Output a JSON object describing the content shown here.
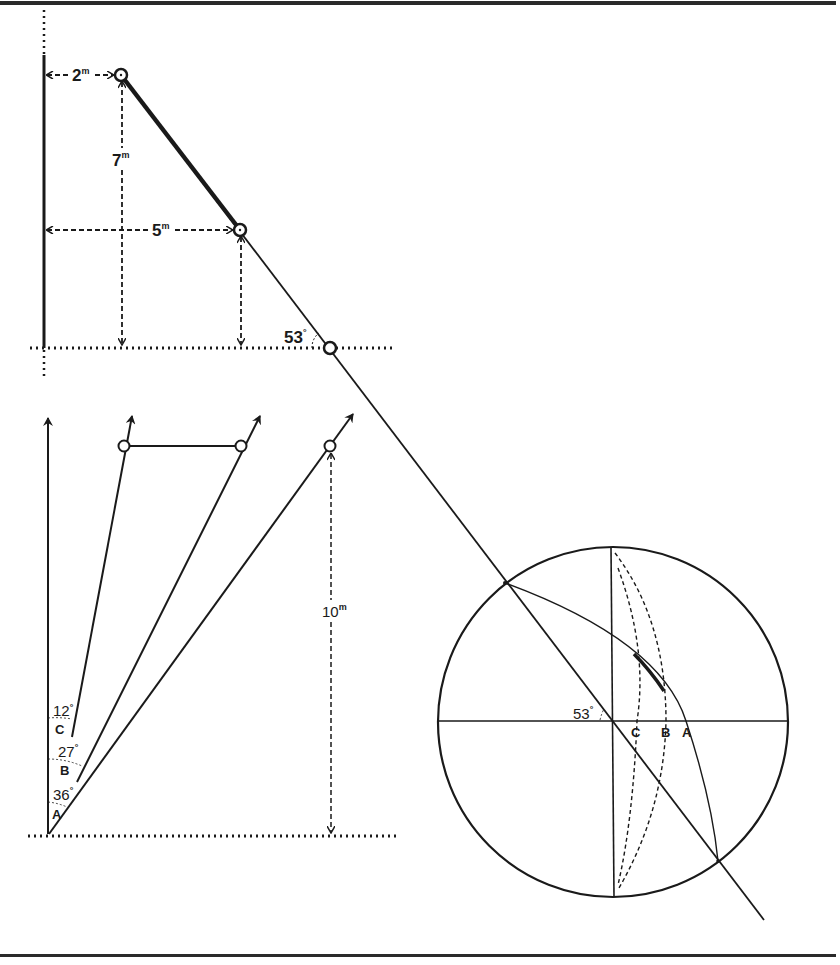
{
  "figure": {
    "colors": {
      "ink": "#1a1a1a",
      "paper": "#ffffff",
      "rule": "#2a2a2a"
    },
    "top_panel": {
      "wall_x": 44,
      "ground_y": 348,
      "labels": {
        "horizontal_offset": "2",
        "horizontal_offset_unit": "m",
        "height": "7",
        "height_unit": "m",
        "span": "5",
        "span_unit": "m",
        "angle": "53",
        "angle_unit": "°"
      },
      "points": [
        {
          "name": "upper-anchor",
          "x": 121,
          "y": 75
        },
        {
          "name": "middle-anchor",
          "x": 240,
          "y": 230
        },
        {
          "name": "ground-point",
          "x": 330,
          "y": 348
        }
      ]
    },
    "bottom_panel": {
      "origin": {
        "x": 48,
        "y": 836
      },
      "labels": {
        "height": "10",
        "height_unit": "m",
        "angle_c": "12",
        "angle_b": "27",
        "angle_a": "36",
        "degree": "°",
        "ray_c": "C",
        "ray_b": "B",
        "ray_a": "A"
      },
      "rays": [
        {
          "name": "vertical",
          "angle_deg": 0
        },
        {
          "name": "C",
          "angle_deg": 12
        },
        {
          "name": "B",
          "angle_deg": 27
        },
        {
          "name": "A",
          "angle_deg": 36
        }
      ],
      "points": [
        {
          "name": "point-c",
          "x": 124,
          "y": 446
        },
        {
          "name": "point-b",
          "x": 241,
          "y": 446
        },
        {
          "name": "point-a",
          "x": 330,
          "y": 446
        }
      ]
    },
    "stereonet": {
      "center": {
        "x": 613,
        "y": 722
      },
      "radius": 175,
      "labels": {
        "angle": "53",
        "angle_unit": "°",
        "c": "C",
        "b": "B",
        "a": "A"
      }
    }
  }
}
